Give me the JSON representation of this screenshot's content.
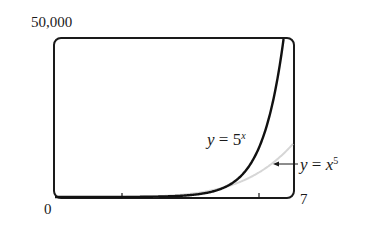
{
  "chart_data": {
    "type": "line",
    "title": "",
    "xlabel": "",
    "ylabel": "",
    "xlim": [
      0,
      7
    ],
    "ylim": [
      0,
      50000
    ],
    "x_tick_labels": [
      "0",
      "7"
    ],
    "y_tick_labels": [
      "50,000"
    ],
    "grid": false,
    "legend": "none (inline annotations)",
    "series": [
      {
        "name": "y = 5^x",
        "color": "#111111",
        "x": [
          0,
          1,
          2,
          3,
          4,
          5,
          6,
          6.72
        ],
        "values": [
          1,
          5,
          25,
          125,
          625,
          3125,
          15625,
          50000
        ]
      },
      {
        "name": "y = x^5",
        "color": "#d8d8d8",
        "x": [
          0,
          1,
          2,
          3,
          4,
          5,
          6,
          7
        ],
        "values": [
          0,
          1,
          32,
          243,
          1024,
          3125,
          7776,
          16807
        ]
      }
    ],
    "annotations": [
      "y = 5^x",
      "y = x^5 (arrow pointing to curve)"
    ]
  },
  "labels": {
    "ymax": "50,000",
    "xmin": "0",
    "xmax": "7",
    "curve1_y": "y",
    "curve1_eq": " = 5",
    "curve1_exp": "x",
    "curve2_y": "y",
    "curve2_eq": " = ",
    "curve2_base": "x",
    "curve2_exp": "5"
  }
}
